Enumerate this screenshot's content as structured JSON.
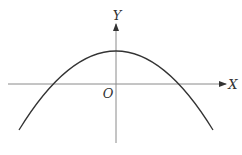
{
  "diagram": {
    "type": "parabola-on-axes",
    "axes": {
      "x_label": "X",
      "y_label": "Y",
      "origin_label": "O"
    },
    "colors": {
      "axis": "#8a8a8a",
      "curve": "#333333",
      "label": "#333333",
      "background": "#ffffff"
    }
  }
}
